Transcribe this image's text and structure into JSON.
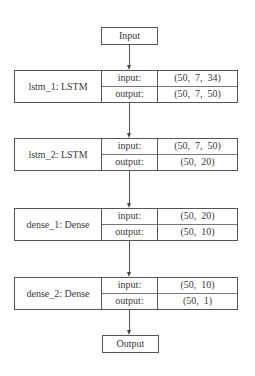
{
  "diagram": {
    "type": "neural-network-model-plot",
    "input_node": {
      "label": "Input"
    },
    "output_node": {
      "label": "Output"
    },
    "layers": [
      {
        "name": "lstm_1: LSTM",
        "input_label": "input:",
        "input_shape": "(50,  7,  34)",
        "output_label": "output:",
        "output_shape": "(50,  7,  50)"
      },
      {
        "name": "lstm_2: LSTM",
        "input_label": "input:",
        "input_shape": "(50,  7,  50)",
        "output_label": "output:",
        "output_shape": "(50,  20)"
      },
      {
        "name": "dense_1: Dense",
        "input_label": "input:",
        "input_shape": "(50,  20)",
        "output_label": "output:",
        "output_shape": "(50,  10)"
      },
      {
        "name": "dense_2: Dense",
        "input_label": "input:",
        "input_shape": "(50,  10)",
        "output_label": "output:",
        "output_shape": "(50,  1)"
      }
    ],
    "edges": [
      {
        "from": "Input",
        "to": "lstm_1"
      },
      {
        "from": "lstm_1",
        "to": "lstm_2"
      },
      {
        "from": "lstm_2",
        "to": "dense_1"
      },
      {
        "from": "dense_1",
        "to": "dense_2"
      },
      {
        "from": "dense_2",
        "to": "Output"
      }
    ],
    "colors": {
      "stroke": "#555555",
      "text": "#3a3a3a",
      "background": "#ffffff"
    }
  }
}
